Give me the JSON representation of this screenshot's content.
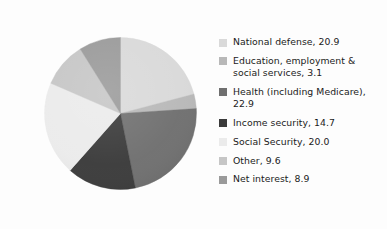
{
  "chart_data": {
    "type": "pie",
    "title": "",
    "subtitle": "",
    "xlabel": "",
    "ylabel": "",
    "legend_position": "right",
    "grid": false,
    "units": "percent",
    "start_angle_deg": 0,
    "direction": "clockwise",
    "categories": [
      "National defense",
      "Education, employment & social services",
      "Health (including Medicare)",
      "Income security",
      "Social Security",
      "Other",
      "Net interest"
    ],
    "values": [
      20.9,
      3.1,
      22.9,
      14.7,
      20.0,
      9.6,
      8.9
    ],
    "colors": [
      "#d9d9d9",
      "#b8b8b8",
      "#6f6f6f",
      "#3a3a3a",
      "#ebebeb",
      "#c6c6c6",
      "#9a9a9a"
    ],
    "total": 100.1
  },
  "legend": {
    "items": [
      {
        "label": "National defense, 20.9",
        "color": "#d9d9d9"
      },
      {
        "label": "Education, employment &\nsocial services, 3.1",
        "color": "#b8b8b8"
      },
      {
        "label": "Health (including Medicare),\n22.9",
        "color": "#6f6f6f"
      },
      {
        "label": "Income security, 14.7",
        "color": "#3a3a3a"
      },
      {
        "label": "Social Security, 20.0",
        "color": "#ebebeb"
      },
      {
        "label": "Other, 9.6",
        "color": "#c6c6c6"
      },
      {
        "label": "Net interest, 8.9",
        "color": "#9a9a9a"
      }
    ]
  }
}
